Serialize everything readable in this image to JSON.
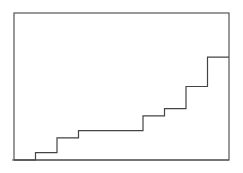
{
  "chart_data": {
    "type": "line",
    "style": "step",
    "title": "",
    "xlabel": "",
    "ylabel": "",
    "x": [
      0,
      1,
      2,
      3,
      4,
      5,
      6,
      7,
      8,
      9,
      10
    ],
    "values": [
      0,
      1,
      3,
      4,
      4,
      4,
      6,
      7,
      10,
      14,
      14
    ],
    "xlim": [
      0,
      10
    ],
    "ylim": [
      0,
      20
    ],
    "grid": false,
    "legend": null,
    "tick_labels": {
      "x": [],
      "y": []
    }
  },
  "colors": {
    "line": "#444444",
    "frame": "#555555",
    "background": "#ffffff"
  }
}
